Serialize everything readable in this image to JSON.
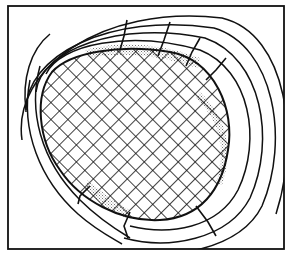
{
  "diagram": {
    "type": "cross-section line drawing",
    "canvas": {
      "width": 292,
      "height": 257,
      "background": "#ffffff"
    },
    "stroke_color": "#111111",
    "stipple_color": "#b8b8b8",
    "frame": {
      "x": 8,
      "y": 6,
      "width": 276,
      "height": 243
    },
    "core": {
      "shape": "tilted oval",
      "fill": "cross-hatch",
      "hatch_spacing": 12,
      "hatch_angle_deg": 45
    },
    "bands": {
      "count": 4,
      "description": "concentric arc layers surrounding the oval on the right side, open toward upper-left and lower-left"
    },
    "stippled_gaps": [
      {
        "location": "top",
        "description": "thin shaded layer between oval and first band"
      },
      {
        "location": "right",
        "description": "shaded crescent along right edge of oval"
      },
      {
        "location": "bottom-left",
        "description": "shaded strip along lower-left edge"
      }
    ],
    "radial_cuts": [
      {
        "location": "top-left",
        "count": 1
      },
      {
        "location": "top",
        "count": 3
      },
      {
        "location": "bottom",
        "count": 2
      },
      {
        "location": "bottom-right",
        "count": 1
      }
    ]
  }
}
